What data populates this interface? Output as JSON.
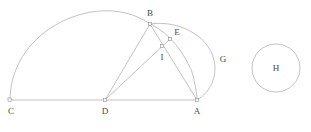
{
  "figure": {
    "title": "",
    "background_color": "#ffffff",
    "stroke_color": "#a8a8a8",
    "label_color": "#4a4a4a",
    "points": [
      {
        "id": "A",
        "label": "A",
        "x": 197,
        "y": 100,
        "label_x": 197,
        "label_y": 114,
        "marker": true
      },
      {
        "id": "B",
        "label": "B",
        "x": 150,
        "y": 24,
        "label_x": 150,
        "label_y": 16,
        "marker": true
      },
      {
        "id": "C",
        "label": "C",
        "x": 10,
        "y": 100,
        "label_x": 11,
        "label_y": 114,
        "marker": true
      },
      {
        "id": "D",
        "label": "D",
        "x": 105,
        "y": 100,
        "label_x": 105,
        "label_y": 114,
        "marker": true
      },
      {
        "id": "E",
        "label": "E",
        "x": 170,
        "y": 39,
        "label_x": 177,
        "label_y": 35,
        "marker": true
      },
      {
        "id": "I",
        "label": "I",
        "x": 162,
        "y": 46,
        "label_x": 162,
        "label_y": 60,
        "marker": true
      },
      {
        "id": "G",
        "label": "G",
        "x": 215,
        "y": 60,
        "label_x": 223,
        "label_y": 62,
        "marker": false
      },
      {
        "id": "H",
        "label": "H",
        "x": 276,
        "y": 68,
        "label_x": 276,
        "label_y": 71,
        "marker": false
      }
    ],
    "segments": [
      {
        "id": "CA",
        "from": "C",
        "to": "A",
        "description": "baseline-c-to-a"
      },
      {
        "id": "DB",
        "from": "D",
        "to": "B",
        "description": "line-d-to-b"
      },
      {
        "id": "DE",
        "from": "D",
        "to": "E",
        "description": "line-d-through-i-to-e"
      },
      {
        "id": "BA",
        "from": "B",
        "to": "A",
        "description": "line-b-to-a"
      }
    ],
    "arcs": [
      {
        "id": "semicircle-CB",
        "description": "large-semicircle-from-c-over-top-to-b-and-a",
        "path": "M 10 100 A 93.5 93.5 0 0 1 150 24"
      },
      {
        "id": "arc-BGA",
        "description": "arc-from-b-through-g-to-a",
        "path": "M 150 24 A 45 45 0 0 1 197 100"
      },
      {
        "id": "arc-BEA",
        "description": "inner-arc-from-b-through-e-to-a",
        "path": "M 150 24 A 62 62 0 0 1 197 100"
      }
    ],
    "circles": [
      {
        "id": "circle-H",
        "description": "standalone-circle-labeled-h",
        "cx": 276,
        "cy": 68,
        "r": 24
      }
    ]
  }
}
